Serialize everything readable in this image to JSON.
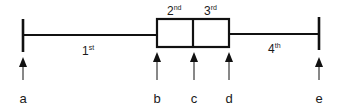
{
  "diagram": {
    "type": "box-plot-quartiles",
    "colors": {
      "stroke": "#111111",
      "text": "#1a1a1a",
      "background": "#ffffff"
    },
    "quartiles": [
      {
        "base": "1",
        "sup": "st"
      },
      {
        "base": "2",
        "sup": "nd"
      },
      {
        "base": "3",
        "sup": "rd"
      },
      {
        "base": "4",
        "sup": "th"
      }
    ],
    "points": [
      {
        "label": "a"
      },
      {
        "label": "b"
      },
      {
        "label": "c"
      },
      {
        "label": "d"
      },
      {
        "label": "e"
      }
    ]
  }
}
